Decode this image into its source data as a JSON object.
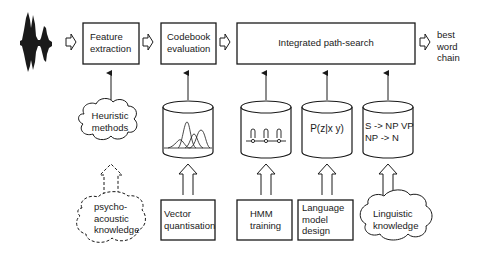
{
  "diagram": {
    "type": "speech-recognition-architecture",
    "top_row": {
      "input_signal": {
        "icon": "speech-waveform-icon"
      },
      "feature_extraction": {
        "line1": "Feature",
        "line2": "extraction"
      },
      "codebook_evaluation": {
        "line1": "Codebook",
        "line2": "evaluation"
      },
      "path_search": {
        "label": "Integrated path-search"
      },
      "output": {
        "line1": "best",
        "line2": "word",
        "line3": "chain"
      }
    },
    "middle_row": {
      "heuristic": {
        "shape": "cloud",
        "line1": "Heuristic",
        "line2": "methods"
      },
      "codebook_db": {
        "shape": "cylinder",
        "icon": "gaussian-distributions-icon"
      },
      "hmm_db": {
        "shape": "cylinder",
        "icon": "hmm-states-icon"
      },
      "lm_db": {
        "shape": "cylinder",
        "text": "P(z|x y)"
      },
      "grammar_db": {
        "shape": "cylinder",
        "line1": "S -> NP VP",
        "line2": "NP -> N"
      }
    },
    "bottom_row": {
      "psychoacoustic": {
        "shape": "dashed-cloud",
        "line1": "psycho-",
        "line2": "acoustic",
        "line3": "knowledge"
      },
      "vector_quantisation": {
        "shape": "box",
        "line1": "Vector",
        "line2": "quantisation"
      },
      "hmm_training": {
        "shape": "box",
        "line1": "HMM",
        "line2": "training"
      },
      "lm_design": {
        "shape": "box",
        "line1": "Language",
        "line2": "model",
        "line3": "design"
      },
      "linguistic": {
        "shape": "cloud",
        "line1": "Linguistic",
        "line2": "knowledge"
      }
    },
    "colors": {
      "stroke": "#1a1a1a",
      "background": "#ffffff"
    }
  }
}
